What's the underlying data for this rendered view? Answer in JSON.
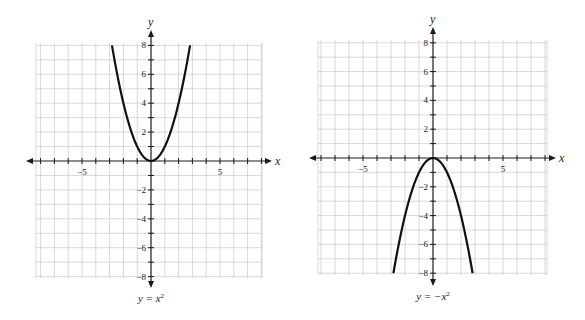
{
  "chart_data": [
    {
      "type": "line",
      "title": "y = x²",
      "caption": "y = x",
      "caption_exp": "2",
      "function": "x^2",
      "xlabel": "x",
      "ylabel": "y",
      "xlim": [
        -8,
        8
      ],
      "ylim": [
        -8,
        8
      ],
      "x_tick_labels": [
        {
          "value": -5,
          "label": "−5"
        },
        {
          "value": 5,
          "label": "5"
        }
      ],
      "y_tick_labels": [
        {
          "value": 8,
          "label": "8"
        },
        {
          "value": 6,
          "label": "6"
        },
        {
          "value": 4,
          "label": "4"
        },
        {
          "value": 2,
          "label": "2"
        },
        {
          "value": -2,
          "label": "−2"
        },
        {
          "value": -4,
          "label": "−4"
        },
        {
          "value": -6,
          "label": "−6"
        },
        {
          "value": -8,
          "label": "−8"
        }
      ],
      "grid": true,
      "x": [
        -2.83,
        -2,
        -1,
        0,
        1,
        2,
        2.83
      ],
      "y": [
        8,
        4,
        1,
        0,
        1,
        4,
        8
      ],
      "layout": {
        "ox": 151,
        "oy": 161,
        "sx": 13.8,
        "sy": 14.45,
        "gx0": 36,
        "gx1": 262,
        "gy0": 43,
        "gy1": 278,
        "ax0": 26,
        "ax1": 272,
        "ay0": 30,
        "ay1": 288
      }
    },
    {
      "type": "line",
      "title": "y = −x²",
      "caption": "y = −x",
      "caption_exp": "2",
      "function": "-x^2",
      "xlabel": "x",
      "ylabel": "y",
      "xlim": [
        -8,
        8
      ],
      "ylim": [
        -8,
        8
      ],
      "x_tick_labels": [
        {
          "value": -5,
          "label": "−5"
        },
        {
          "value": 5,
          "label": "5"
        }
      ],
      "y_tick_labels": [
        {
          "value": 8,
          "label": "8"
        },
        {
          "value": 6,
          "label": "6"
        },
        {
          "value": 4,
          "label": "4"
        },
        {
          "value": 2,
          "label": "2"
        },
        {
          "value": -2,
          "label": "−2"
        },
        {
          "value": -4,
          "label": "−4"
        },
        {
          "value": -6,
          "label": "−6"
        },
        {
          "value": -8,
          "label": "−8"
        }
      ],
      "grid": true,
      "x": [
        -2.83,
        -2,
        -1,
        0,
        1,
        2,
        2.83
      ],
      "y": [
        -8,
        -4,
        -1,
        0,
        -1,
        -4,
        -8
      ],
      "layout": {
        "ox": 433,
        "oy": 158,
        "sx": 14.0,
        "sy": 14.4,
        "gx0": 318,
        "gx1": 547,
        "gy0": 40,
        "gy1": 275,
        "ax0": 309,
        "ax1": 556,
        "ay0": 27,
        "ay1": 286
      }
    }
  ]
}
